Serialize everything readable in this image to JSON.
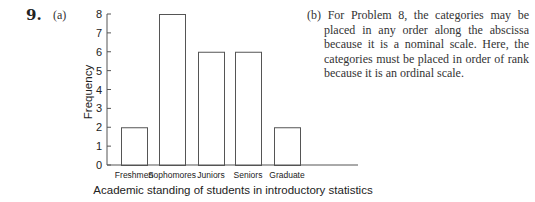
{
  "problem": {
    "number": "9.",
    "part_a_label": "(a)",
    "part_b_label": "(b)",
    "part_b_text": "For Problem 8, the categories may be placed in any order along the abscissa because it is a nominal scale. Here, the categories must be placed in order of rank because it is an ordinal scale."
  },
  "chart_data": {
    "type": "bar",
    "title": "",
    "xlabel": "Academic standing of students in introductory statistics",
    "ylabel": "Frequency",
    "categories": [
      "Freshmen",
      "Sophomores",
      "Juniors",
      "Seniors",
      "Graduate"
    ],
    "values": [
      2,
      8,
      6,
      6,
      2
    ],
    "ylim": [
      0,
      8
    ],
    "yticks": [
      0,
      1,
      2,
      3,
      4,
      5,
      6,
      7,
      8
    ],
    "grid": false,
    "legend": null
  }
}
